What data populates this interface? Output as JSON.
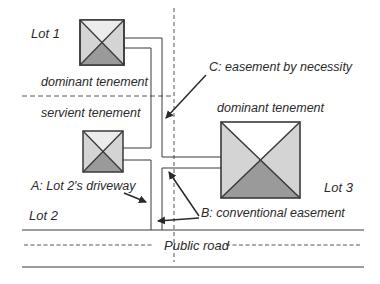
{
  "diagram": {
    "type": "easement-site-plan",
    "colors": {
      "line": "#3a3a3a",
      "light_fill": "#d4d4d4",
      "dark_fill": "#9a9a9a",
      "white_fill": "#ffffff",
      "text": "#2a2a2a"
    },
    "lots": [
      {
        "id": "lot1",
        "label": "Lot 1",
        "role_label": "dominant tenement"
      },
      {
        "id": "lot2",
        "label": "Lot 2",
        "role_label": "servient tenement"
      },
      {
        "id": "lot3",
        "label": "Lot 3",
        "role_label": "dominant tenement"
      }
    ],
    "annotations": {
      "a": "A: Lot 2's driveway",
      "b": "B: conventional easement",
      "c": "C: easement by necessity"
    },
    "road": {
      "label": "Public road"
    }
  }
}
